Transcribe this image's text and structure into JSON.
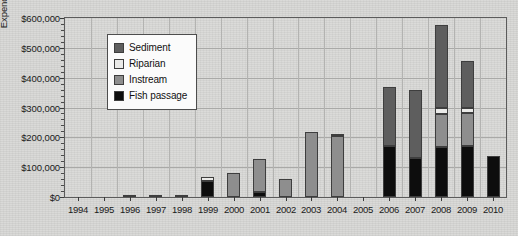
{
  "chart_data": {
    "type": "bar",
    "subtype": "stacked-bar",
    "title": "",
    "xlabel": "",
    "ylabel": "Expenditures",
    "ylim": [
      0,
      600000
    ],
    "ytick_values": [
      0,
      100000,
      200000,
      300000,
      400000,
      500000,
      600000
    ],
    "ytick_labels": [
      "$0",
      "$100,000",
      "$200,000",
      "$300,000",
      "$400,000",
      "$500,000",
      "$600,000"
    ],
    "grid": true,
    "grid_axis": "both",
    "legend_position": "upper-left-inside",
    "categories": [
      "1994",
      "1995",
      "1996",
      "1997",
      "1998",
      "1999",
      "2000",
      "2001",
      "2002",
      "2003",
      "2004",
      "2005",
      "2006",
      "2007",
      "2008",
      "2009",
      "2010"
    ],
    "series": [
      {
        "name": "Fish passage",
        "color": "#0d0d0d",
        "values": [
          0,
          0,
          5000,
          4000,
          5000,
          55000,
          0,
          18000,
          0,
          0,
          0,
          0,
          170000,
          130000,
          168000,
          172000,
          138000
        ]
      },
      {
        "name": "Instream",
        "color": "#8e8e8e",
        "values": [
          0,
          0,
          0,
          0,
          0,
          0,
          80000,
          110000,
          60000,
          218000,
          205000,
          0,
          0,
          0,
          110000,
          108000,
          0
        ]
      },
      {
        "name": "Riparian",
        "color": "#eaeae8",
        "values": [
          0,
          0,
          0,
          0,
          0,
          13000,
          0,
          0,
          0,
          0,
          7000,
          0,
          0,
          0,
          22000,
          20000,
          0
        ]
      },
      {
        "name": "Sediment",
        "color": "#5e5e5e",
        "values": [
          0,
          0,
          0,
          0,
          0,
          0,
          0,
          0,
          0,
          0,
          0,
          0,
          200000,
          230000,
          278000,
          155000,
          0
        ]
      }
    ],
    "totals": [
      0,
      0,
      5000,
      4000,
      5000,
      68000,
      80000,
      128000,
      60000,
      218000,
      212000,
      0,
      370000,
      360000,
      578000,
      455000,
      138000
    ],
    "stack_order_bottom_to_top": [
      "Fish passage",
      "Instream",
      "Riparian",
      "Sediment"
    ]
  },
  "legend": {
    "items": [
      {
        "label": "Sediment",
        "color": "#5e5e5e"
      },
      {
        "label": "Riparian",
        "color": "#eaeae8"
      },
      {
        "label": "Instream",
        "color": "#8e8e8e"
      },
      {
        "label": "Fish passage",
        "color": "#0d0d0d"
      }
    ]
  },
  "axis": {
    "y_title": "Expenditures"
  }
}
